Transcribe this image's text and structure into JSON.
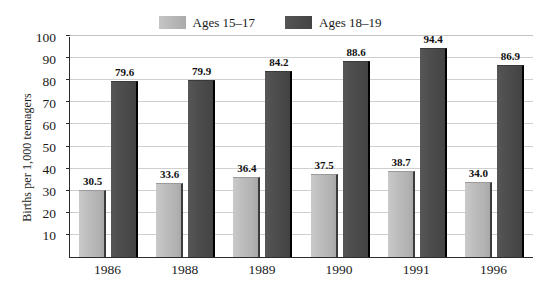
{
  "chart_data": {
    "type": "bar",
    "title": "",
    "subtitle": "",
    "xlabel": "",
    "ylabel": "Births per 1,000 teenagers",
    "categories": [
      "1986",
      "1988",
      "1989",
      "1990",
      "1991",
      "1996"
    ],
    "series": [
      {
        "name": "Ages 15–17",
        "color": "#bcbcbc",
        "values": [
          30.5,
          33.6,
          36.4,
          37.5,
          38.7,
          34.0
        ],
        "labels": [
          "30.5",
          "33.6",
          "36.4",
          "37.5",
          "38.7",
          "34.0"
        ]
      },
      {
        "name": "Ages 18–19",
        "color": "#4d4d4d",
        "values": [
          79.6,
          79.9,
          84.2,
          88.6,
          94.4,
          86.9
        ],
        "labels": [
          "79.6",
          "79.9",
          "84.2",
          "88.6",
          "94.4",
          "86.9"
        ]
      }
    ],
    "ylim": [
      0,
      100
    ],
    "y_ticks": [
      10,
      20,
      30,
      40,
      50,
      60,
      70,
      80,
      90,
      100
    ],
    "y_tick_labels": [
      "10",
      "20",
      "30",
      "40",
      "50",
      "60",
      "70",
      "80",
      "90",
      "100"
    ],
    "grid": true,
    "grid_axis": "y",
    "legend_position": "top-center"
  },
  "legend": {
    "entries": [
      {
        "label": "Ages 15–17",
        "swatch": "light-gray-swatch"
      },
      {
        "label": "Ages 18–19",
        "swatch": "dark-gray-swatch"
      }
    ]
  },
  "axes": {
    "y_title": "Births per 1,000 teenagers",
    "y_tick_labels": [
      "100",
      "90",
      "80",
      "70",
      "60",
      "50",
      "40",
      "30",
      "20",
      "10"
    ],
    "x_tick_labels": [
      "1986",
      "1988",
      "1989",
      "1990",
      "1991",
      "1996"
    ]
  },
  "colors": {
    "series_light": "#bcbcbc",
    "series_dark": "#4d4d4d",
    "gridline": "#cfcfcf",
    "axis": "#2b2b2b",
    "text": "#1a1a1a",
    "background": "#ffffff"
  }
}
